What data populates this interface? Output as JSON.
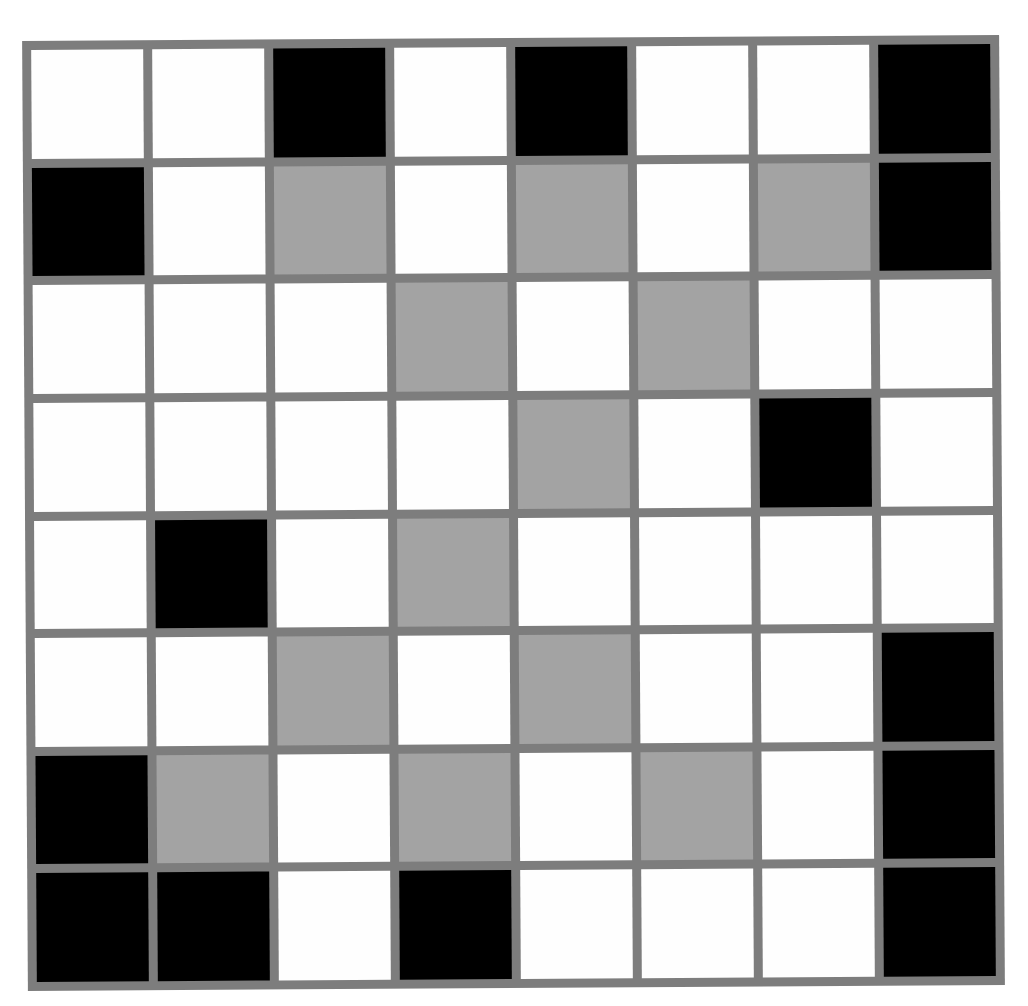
{
  "puzzle": {
    "rows": 8,
    "cols": 8,
    "legend": {
      "B": "black",
      "G": "gray",
      "W": "white"
    },
    "colors": {
      "border": "#7d7d7d",
      "black": "#000000",
      "gray": "#a3a3a3",
      "white": "#fefefe"
    },
    "grid": [
      [
        "W",
        "W",
        "B",
        "W",
        "B",
        "W",
        "W",
        "B"
      ],
      [
        "B",
        "W",
        "G",
        "W",
        "G",
        "W",
        "G",
        "B"
      ],
      [
        "W",
        "W",
        "W",
        "G",
        "W",
        "G",
        "W",
        "W"
      ],
      [
        "W",
        "W",
        "W",
        "W",
        "G",
        "W",
        "B",
        "W"
      ],
      [
        "W",
        "B",
        "W",
        "G",
        "W",
        "W",
        "W",
        "W"
      ],
      [
        "W",
        "W",
        "G",
        "W",
        "G",
        "W",
        "W",
        "B"
      ],
      [
        "B",
        "G",
        "W",
        "G",
        "W",
        "G",
        "W",
        "B"
      ],
      [
        "B",
        "B",
        "W",
        "B",
        "W",
        "W",
        "W",
        "B"
      ]
    ]
  }
}
